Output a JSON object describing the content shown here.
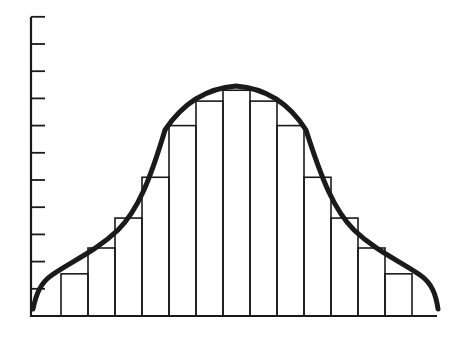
{
  "chart_data": {
    "type": "bar",
    "title": "",
    "xlabel": "",
    "ylabel": "",
    "grid": false,
    "legend": null,
    "y_ticks": 11,
    "ylim": [
      0,
      11
    ],
    "categories": [
      "1",
      "2",
      "3",
      "4",
      "5",
      "6",
      "7",
      "8",
      "9",
      "10",
      "11",
      "12",
      "13",
      "14"
    ],
    "values": [
      1.55,
      2.5,
      3.6,
      5.1,
      7.0,
      7.9,
      8.3,
      7.9,
      7.0,
      5.1,
      3.6,
      2.5,
      1.55,
      0.0
    ],
    "bars": [
      {
        "x0": 61,
        "x1": 88,
        "value": 1.55
      },
      {
        "x0": 88,
        "x1": 115,
        "value": 2.5
      },
      {
        "x0": 115,
        "x1": 142,
        "value": 3.6
      },
      {
        "x0": 142,
        "x1": 169,
        "value": 5.1
      },
      {
        "x0": 169,
        "x1": 196,
        "value": 7.0
      },
      {
        "x0": 196,
        "x1": 223,
        "value": 7.9
      },
      {
        "x0": 223,
        "x1": 250,
        "value": 8.3
      },
      {
        "x0": 250,
        "x1": 277,
        "value": 7.9
      },
      {
        "x0": 277,
        "x1": 304,
        "value": 7.0
      },
      {
        "x0": 304,
        "x1": 331,
        "value": 5.1
      },
      {
        "x0": 331,
        "x1": 358,
        "value": 3.6
      },
      {
        "x0": 358,
        "x1": 385,
        "value": 2.5
      },
      {
        "x0": 385,
        "x1": 412,
        "value": 1.55
      }
    ],
    "curve": "bell-shaped smooth curve overlay",
    "colors": {
      "stroke": "#1a1a1a",
      "background": "#ffffff"
    }
  }
}
